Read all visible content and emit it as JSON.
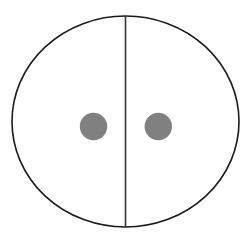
{
  "diagram": {
    "outline_color": "#1a1a1a",
    "divider_color": "#333333",
    "dot_color": "#808080",
    "background_color": "#ffffff",
    "dots": [
      {
        "name": "left-dot",
        "half": "left"
      },
      {
        "name": "right-dot",
        "half": "right"
      }
    ]
  }
}
